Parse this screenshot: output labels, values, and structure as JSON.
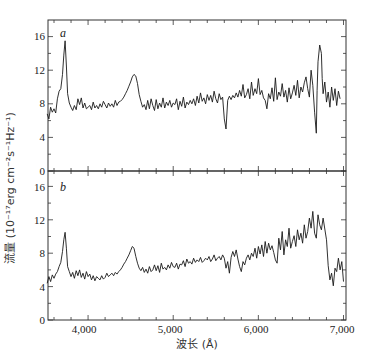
{
  "chart_data": [
    {
      "panel": "a",
      "type": "line",
      "title": "",
      "panel_label": "a",
      "xlabel": "波长 (Å)",
      "ylabel": "流量 (10⁻¹⁷erg cm⁻²s⁻¹Hz⁻¹)",
      "xlim": [
        3500,
        7000
      ],
      "ylim": [
        0,
        18
      ],
      "yticks": [
        0,
        4,
        8,
        12,
        16
      ],
      "xticks": [
        4000,
        5000,
        6000,
        7000
      ],
      "grid": false,
      "series": [
        {
          "name": "spectrum a",
          "x": [
            3520,
            3540,
            3560,
            3580,
            3600,
            3620,
            3640,
            3660,
            3680,
            3700,
            3715,
            3730,
            3745,
            3760,
            3780,
            3800,
            3820,
            3840,
            3860,
            3880,
            3900,
            3920,
            3940,
            3960,
            3980,
            4000,
            4020,
            4040,
            4060,
            4080,
            4100,
            4120,
            4140,
            4160,
            4180,
            4200,
            4220,
            4240,
            4260,
            4280,
            4300,
            4320,
            4340,
            4360,
            4380,
            4400,
            4420,
            4440,
            4460,
            4480,
            4500,
            4520,
            4540,
            4560,
            4580,
            4600,
            4620,
            4640,
            4660,
            4680,
            4700,
            4720,
            4740,
            4760,
            4780,
            4800,
            4820,
            4840,
            4860,
            4880,
            4900,
            4920,
            4940,
            4960,
            4980,
            5000,
            5020,
            5040,
            5060,
            5080,
            5100,
            5120,
            5140,
            5160,
            5180,
            5200,
            5220,
            5240,
            5260,
            5280,
            5300,
            5320,
            5340,
            5360,
            5380,
            5400,
            5420,
            5440,
            5460,
            5480,
            5500,
            5520,
            5540,
            5560,
            5580,
            5600,
            5620,
            5640,
            5660,
            5680,
            5700,
            5720,
            5740,
            5760,
            5780,
            5800,
            5820,
            5840,
            5860,
            5880,
            5900,
            5920,
            5940,
            5960,
            5980,
            6000,
            6020,
            6040,
            6060,
            6080,
            6100,
            6120,
            6140,
            6160,
            6180,
            6200,
            6220,
            6240,
            6260,
            6280,
            6300,
            6320,
            6340,
            6360,
            6380,
            6400,
            6420,
            6440,
            6460,
            6480,
            6500,
            6520,
            6540,
            6560,
            6580,
            6600,
            6620,
            6640,
            6660,
            6680,
            6690,
            6700,
            6720,
            6740,
            6750,
            6760,
            6780,
            6800,
            6820,
            6840,
            6860,
            6880,
            6900,
            6920,
            6940,
            6960,
            6980,
            7000
          ],
          "values": [
            6.8,
            6.2,
            7.6,
            7.0,
            7.4,
            6.9,
            8.6,
            9.5,
            9.8,
            11.5,
            13.8,
            15.5,
            12.5,
            9.2,
            8.1,
            7.6,
            7.2,
            7.8,
            7.3,
            8.6,
            7.9,
            8.7,
            7.5,
            8.1,
            7.4,
            7.6,
            7.8,
            7.3,
            8.2,
            7.5,
            7.8,
            7.4,
            8.0,
            7.6,
            8.3,
            7.9,
            7.5,
            8.1,
            7.7,
            8.0,
            7.6,
            8.4,
            7.8,
            8.2,
            8.3,
            8.5,
            8.8,
            9.2,
            9.6,
            10.1,
            10.6,
            11.2,
            11.5,
            11.3,
            10.4,
            9.1,
            8.3,
            7.6,
            7.9,
            7.3,
            8.4,
            7.4,
            8.6,
            7.8,
            7.2,
            8.5,
            7.4,
            8.1,
            7.6,
            8.7,
            7.5,
            8.2,
            7.8,
            8.4,
            7.6,
            8.1,
            7.9,
            8.6,
            7.3,
            8.3,
            7.7,
            8.8,
            7.5,
            8.2,
            7.9,
            8.4,
            8.0,
            8.6,
            7.8,
            8.9,
            8.1,
            9.3,
            8.3,
            8.7,
            8.0,
            9.1,
            8.4,
            9.0,
            8.2,
            9.5,
            8.6,
            8.1,
            9.2,
            8.5,
            8.8,
            6.2,
            5.0,
            8.4,
            8.9,
            8.5,
            9.0,
            8.7,
            9.3,
            8.8,
            9.6,
            8.9,
            10.3,
            8.7,
            9.1,
            9.8,
            8.6,
            10.6,
            9.0,
            9.8,
            9.2,
            11.0,
            9.1,
            9.6,
            8.7,
            8.4,
            7.4,
            9.2,
            8.6,
            9.9,
            8.3,
            11.1,
            8.5,
            9.4,
            8.9,
            10.4,
            8.8,
            9.6,
            8.2,
            9.9,
            8.6,
            9.3,
            10.2,
            9.0,
            10.8,
            8.7,
            10.0,
            9.4,
            10.5,
            11.2,
            9.8,
            8.8,
            12.0,
            10.2,
            7.0,
            4.5,
            9.6,
            13.0,
            15.0,
            14.0,
            11.0,
            9.2,
            10.6,
            8.2,
            9.4,
            7.6,
            10.0,
            8.4,
            9.8,
            7.8,
            9.5,
            8.6
          ]
        }
      ]
    },
    {
      "panel": "b",
      "type": "line",
      "title": "",
      "panel_label": "b",
      "xlabel": "波长 (Å)",
      "ylabel": "流量 (10⁻¹⁷erg cm⁻²s⁻¹Hz⁻¹)",
      "xlim": [
        3500,
        7000
      ],
      "ylim": [
        0,
        18
      ],
      "yticks": [
        0,
        4,
        8,
        12,
        16
      ],
      "xticks": [
        4000,
        5000,
        6000,
        7000
      ],
      "grid": false,
      "series": [
        {
          "name": "spectrum b",
          "x": [
            3520,
            3540,
            3560,
            3580,
            3600,
            3620,
            3640,
            3660,
            3680,
            3700,
            3715,
            3730,
            3745,
            3760,
            3780,
            3800,
            3820,
            3840,
            3860,
            3880,
            3900,
            3920,
            3940,
            3960,
            3980,
            4000,
            4020,
            4040,
            4060,
            4080,
            4100,
            4120,
            4140,
            4160,
            4180,
            4200,
            4220,
            4240,
            4260,
            4280,
            4300,
            4320,
            4340,
            4360,
            4380,
            4400,
            4420,
            4440,
            4460,
            4480,
            4500,
            4520,
            4540,
            4560,
            4580,
            4600,
            4620,
            4640,
            4660,
            4680,
            4700,
            4720,
            4740,
            4760,
            4780,
            4800,
            4820,
            4840,
            4860,
            4880,
            4900,
            4920,
            4940,
            4960,
            4980,
            5000,
            5020,
            5040,
            5060,
            5080,
            5100,
            5120,
            5140,
            5160,
            5180,
            5200,
            5220,
            5240,
            5260,
            5280,
            5300,
            5320,
            5340,
            5360,
            5380,
            5400,
            5420,
            5440,
            5460,
            5480,
            5500,
            5520,
            5540,
            5560,
            5580,
            5600,
            5620,
            5640,
            5660,
            5680,
            5700,
            5720,
            5740,
            5760,
            5780,
            5800,
            5820,
            5840,
            5860,
            5880,
            5900,
            5920,
            5940,
            5960,
            5980,
            6000,
            6020,
            6040,
            6060,
            6080,
            6100,
            6120,
            6140,
            6160,
            6180,
            6200,
            6220,
            6240,
            6260,
            6280,
            6300,
            6320,
            6340,
            6360,
            6380,
            6400,
            6420,
            6440,
            6460,
            6480,
            6500,
            6520,
            6540,
            6560,
            6580,
            6600,
            6620,
            6640,
            6660,
            6680,
            6700,
            6720,
            6740,
            6760,
            6780,
            6800,
            6820,
            6840,
            6860,
            6880,
            6900,
            6920,
            6940,
            6960,
            6980,
            7000
          ],
          "values": [
            4.4,
            5.2,
            4.6,
            5.4,
            5.0,
            5.5,
            5.8,
            6.4,
            6.9,
            8.2,
            9.6,
            10.5,
            8.6,
            6.4,
            5.8,
            5.2,
            5.7,
            5.0,
            5.9,
            5.3,
            6.0,
            5.1,
            5.6,
            4.9,
            5.8,
            5.2,
            5.5,
            4.8,
            5.3,
            4.7,
            5.2,
            5.0,
            4.8,
            5.3,
            4.9,
            5.1,
            5.6,
            5.2,
            5.4,
            5.6,
            5.3,
            5.7,
            5.5,
            5.8,
            6.0,
            6.3,
            6.7,
            7.0,
            7.4,
            7.8,
            8.3,
            8.8,
            8.6,
            7.6,
            6.8,
            6.2,
            5.9,
            6.3,
            5.7,
            6.1,
            5.6,
            6.4,
            5.8,
            6.0,
            6.6,
            5.9,
            6.5,
            5.7,
            6.8,
            6.1,
            6.3,
            6.0,
            6.6,
            6.2,
            6.9,
            6.4,
            6.3,
            6.8,
            6.1,
            6.7,
            6.6,
            7.1,
            6.4,
            7.3,
            6.8,
            7.0,
            6.7,
            7.4,
            6.9,
            7.2,
            7.0,
            7.5,
            6.9,
            7.1,
            7.4,
            7.2,
            7.6,
            7.0,
            7.3,
            7.8,
            7.1,
            7.4,
            7.6,
            7.2,
            7.8,
            7.4,
            6.2,
            7.0,
            5.6,
            7.5,
            8.2,
            7.6,
            8.4,
            7.3,
            6.4,
            5.8,
            7.0,
            6.6,
            7.4,
            7.8,
            7.2,
            8.0,
            7.6,
            8.6,
            7.4,
            8.8,
            7.9,
            9.0,
            7.6,
            9.4,
            8.0,
            9.2,
            8.4,
            8.9,
            8.1,
            7.2,
            6.8,
            9.8,
            8.4,
            10.6,
            7.8,
            9.6,
            8.8,
            11.0,
            8.6,
            9.4,
            10.1,
            8.8,
            10.8,
            9.6,
            10.4,
            9.2,
            11.4,
            9.8,
            10.6,
            12.2,
            11.0,
            13.0,
            10.4,
            9.8,
            12.6,
            11.4,
            10.8,
            12.2,
            10.9,
            9.6,
            6.5,
            4.8,
            5.6,
            4.1,
            6.2,
            5.8,
            7.4,
            6.0,
            7.0,
            4.6
          ]
        }
      ]
    }
  ],
  "figure": {
    "panel_a_label": "a",
    "panel_b_label": "b",
    "x_axis_title": "波长 (Å)",
    "y_axis_title": "流量 (10⁻¹⁷erg cm⁻²s⁻¹Hz⁻¹)",
    "x_tick_labels": [
      "4,000",
      "5,000",
      "6,000",
      "7,000"
    ],
    "y_tick_labels_a": [
      "0",
      "4",
      "8",
      "12",
      "16"
    ],
    "y_tick_labels_b": [
      "0",
      "4",
      "8",
      "12",
      "16"
    ],
    "line_color": "#1a1a1a",
    "frame_color": "#333333",
    "tick_label_color": "#222222"
  }
}
